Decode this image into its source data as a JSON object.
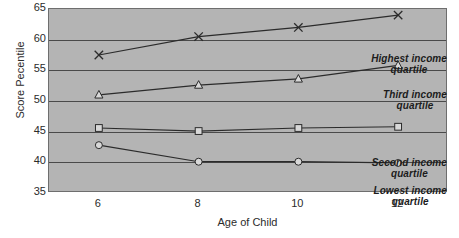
{
  "chart_data": {
    "type": "line",
    "title": "",
    "xlabel": "Age of Child",
    "ylabel": "Score Pecentile",
    "x": [
      6,
      8,
      10,
      12
    ],
    "xtick_labels": [
      "6",
      "8",
      "10",
      "12"
    ],
    "ytick_labels": [
      "65",
      "60",
      "55",
      "50",
      "45",
      "40",
      "35"
    ],
    "yticks": [
      65,
      60,
      55,
      50,
      45,
      40,
      35
    ],
    "xlim": [
      5,
      13
    ],
    "ylim": [
      35,
      65
    ],
    "grid": "horizontal",
    "legend_position": "inline-right-annotations",
    "plot_background": "#b4b4b4",
    "line_color": "#2b2b2b",
    "marker_fill": "#d8d8d8",
    "series": [
      {
        "name": "Highest income quartile",
        "marker": "x",
        "values": [
          57.5,
          60.5,
          62.0,
          64.0
        ],
        "annotation_lines": [
          "Highest income",
          "quartile"
        ]
      },
      {
        "name": "Third income quartile",
        "marker": "triangle",
        "values": [
          51.0,
          52.6,
          53.6,
          55.8
        ],
        "annotation_lines": [
          "Third income",
          "quartile"
        ]
      },
      {
        "name": "Second income quartile",
        "marker": "square",
        "values": [
          45.6,
          45.1,
          45.6,
          45.8
        ],
        "annotation_lines": [
          "Second income",
          "quartile"
        ]
      },
      {
        "name": "Lowest income quartile",
        "marker": "circle",
        "values": [
          42.8,
          40.1,
          40.1,
          39.9
        ],
        "annotation_lines": [
          "Lowest income",
          "quartile"
        ]
      }
    ],
    "annotations": [
      {
        "lines": [
          "Highest income",
          "quartile"
        ],
        "x_px": 398,
        "y_px": 44
      },
      {
        "lines": [
          "Third income",
          "quartile"
        ],
        "x_px": 398,
        "y_px": 80
      },
      {
        "lines": [
          "Second income",
          "quartile"
        ],
        "x_px": 398,
        "y_px": 148
      },
      {
        "lines": [
          "Lowest income",
          "quartile"
        ],
        "x_px": 398,
        "y_px": 176
      }
    ]
  }
}
